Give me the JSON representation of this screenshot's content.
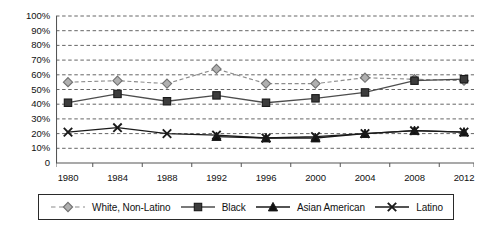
{
  "chart_data": {
    "type": "line",
    "title": "",
    "xlabel": "",
    "ylabel": "",
    "categories": [
      "1980",
      "1984",
      "1988",
      "1992",
      "1996",
      "2000",
      "2004",
      "2008",
      "2012"
    ],
    "ylim": [
      0,
      100
    ],
    "ytick_labels": [
      "100%",
      "90%",
      "80%",
      "70%",
      "60%",
      "50%",
      "40%",
      "30%",
      "20%",
      "10%",
      "0"
    ],
    "ytick_values": [
      100,
      90,
      80,
      70,
      60,
      50,
      40,
      30,
      20,
      10,
      0
    ],
    "grid": true,
    "grid_style": "dashed-horizontal",
    "legend_position": "bottom",
    "series": [
      {
        "name": "White, Non-Latino",
        "marker": "diamond",
        "line_style": "dashed",
        "color": "#8c8c8c",
        "marker_fill": "#b0b0b0",
        "values": [
          55,
          56,
          54,
          64,
          54,
          54,
          58,
          57,
          56
        ]
      },
      {
        "name": "Black",
        "marker": "square",
        "line_style": "solid",
        "color": "#4d4d4d",
        "marker_fill": "#3c3c3c",
        "values": [
          41,
          47,
          42,
          46,
          41,
          44,
          48,
          56,
          57
        ]
      },
      {
        "name": "Asian American",
        "marker": "triangle",
        "line_style": "solid",
        "color": "#1a1a1a",
        "marker_fill": "#111111",
        "values": [
          null,
          null,
          null,
          18,
          17,
          17,
          20,
          22,
          21
        ]
      },
      {
        "name": "Latino",
        "marker": "x",
        "line_style": "solid",
        "color": "#1a1a1a",
        "marker_fill": "#111111",
        "values": [
          21,
          24,
          20,
          19,
          17,
          18,
          20,
          22,
          21
        ]
      }
    ]
  },
  "legend": {
    "items": [
      {
        "label": "White,  Non-Latino"
      },
      {
        "label": "Black"
      },
      {
        "label": "Asian  American"
      },
      {
        "label": "Latino"
      }
    ]
  }
}
